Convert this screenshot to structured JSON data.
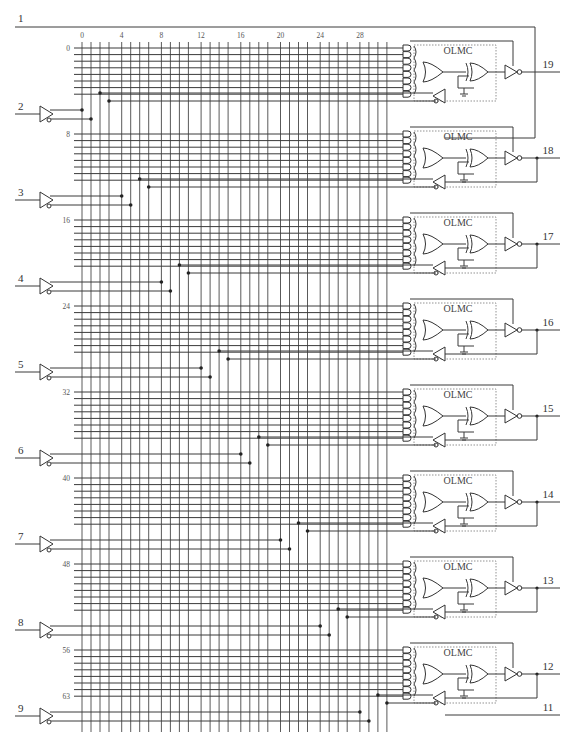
{
  "diagram": {
    "colors": {
      "wire": "#3a3a3a",
      "grid": "#5a5a5a",
      "dot": "#222222",
      "background": "#ffffff"
    },
    "column_labels": [
      "0",
      "4",
      "8",
      "12",
      "16",
      "20",
      "24",
      "28"
    ],
    "row_labels": [
      "0",
      "8",
      "16",
      "24",
      "32",
      "40",
      "48",
      "56",
      "63"
    ],
    "input_pins": [
      {
        "pin": "1",
        "role": "clock/bus"
      },
      {
        "pin": "2"
      },
      {
        "pin": "3"
      },
      {
        "pin": "4"
      },
      {
        "pin": "5"
      },
      {
        "pin": "6"
      },
      {
        "pin": "7"
      },
      {
        "pin": "8"
      },
      {
        "pin": "9"
      }
    ],
    "olmc_label": "OLMC",
    "output_pins": [
      "19",
      "18",
      "17",
      "16",
      "15",
      "14",
      "13",
      "12"
    ],
    "extra_pin": "11",
    "counts": {
      "input_columns": 32,
      "product_terms_per_olmc": 8,
      "olmcs": 8,
      "product_terms_total": 64
    }
  }
}
